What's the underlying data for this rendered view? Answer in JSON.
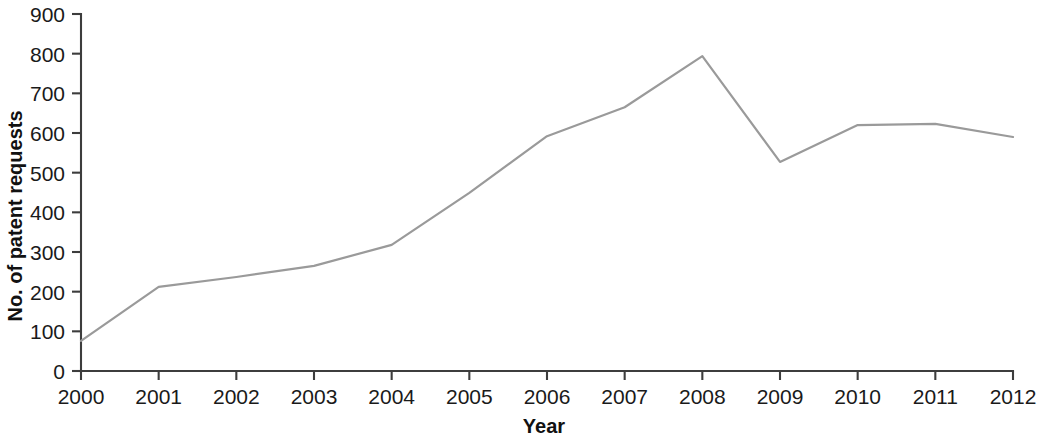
{
  "chart_data": {
    "type": "line",
    "title": "",
    "xlabel": "Year",
    "ylabel": "No. of patent requests",
    "categories": [
      "2000",
      "2001",
      "2002",
      "2003",
      "2004",
      "2005",
      "2006",
      "2007",
      "2008",
      "2009",
      "2010",
      "2011",
      "2012"
    ],
    "x": [
      2000,
      2001,
      2002,
      2003,
      2004,
      2005,
      2006,
      2007,
      2008,
      2009,
      2010,
      2011,
      2012
    ],
    "values": [
      76,
      212,
      237,
      265,
      318,
      449,
      592,
      665,
      794,
      527,
      620,
      623,
      590
    ],
    "series": [
      {
        "name": "No. of patent requests",
        "values": [
          76,
          212,
          237,
          265,
          318,
          449,
          592,
          665,
          794,
          527,
          620,
          623,
          590
        ]
      }
    ],
    "xlim": [
      2000,
      2012
    ],
    "ylim": [
      0,
      900
    ],
    "y_ticks": [
      "0",
      "100",
      "200",
      "300",
      "400",
      "500",
      "600",
      "700",
      "800",
      "900"
    ],
    "y_tick_values": [
      0,
      100,
      200,
      300,
      400,
      500,
      600,
      700,
      800,
      900
    ],
    "x_ticks": [
      "2000",
      "2001",
      "2002",
      "2003",
      "2004",
      "2005",
      "2006",
      "2007",
      "2008",
      "2009",
      "2010",
      "2011",
      "2012"
    ],
    "grid": false,
    "legend": false,
    "legend_position": "none",
    "line_color": "#9a9a9a",
    "axis_color": "#3d3d3d",
    "text_color": "#1a1a1a",
    "background_color": "#ffffff"
  }
}
